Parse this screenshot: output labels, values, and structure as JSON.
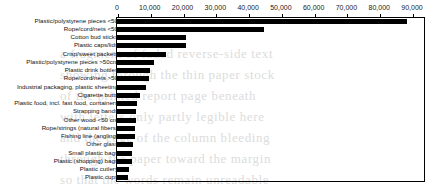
{
  "chart_data": {
    "type": "bar",
    "orientation": "horizontal",
    "title": "",
    "subtitle": "",
    "xlabel": "",
    "ylabel": "",
    "xlim": [
      0,
      90000
    ],
    "grid": false,
    "legend": null,
    "axis_position": "top",
    "bar_color": "#000000",
    "frame_color": "#000000",
    "background": "#ffffff",
    "xticks": [
      0,
      10000,
      20000,
      30000,
      40000,
      50000,
      60000,
      70000,
      80000,
      90000
    ],
    "xticklabels": [
      "0",
      "10,000",
      "20,000",
      "30,000",
      "40,000",
      "50,000",
      "60,000",
      "70,000",
      "80,000",
      "90,000"
    ],
    "categories": [
      "Plastic/polystyrene pieces <50",
      "Rope/cord/nets <50",
      "Cotton bud sticks",
      "Plastic caps/lids",
      "Crisp/sweet packets",
      "Plastic/polystyrene pieces >50cm",
      "Plastic drink bottles",
      "Rope/cord/nets >50",
      "Industrial packaging, plastic sheeting",
      "Cigarette butts",
      "Plastic food, incl. fast food, containers",
      "Strapping bands",
      "Other wood <50 cm",
      "Rope/strings (natural fibers)",
      "Fishing line (angling)",
      "Other glass",
      "Small plastic bags",
      "Plastic (shopping) bags",
      "Plastic cutlery",
      "Plastic cups"
    ],
    "values": [
      88500,
      44800,
      21200,
      21000,
      14800,
      11400,
      10100,
      9700,
      8800,
      7000,
      6000,
      5900,
      5700,
      5500,
      5400,
      5000,
      4700,
      4600,
      3700,
      3500
    ]
  },
  "ghost_text": [
    "a fragment of faded reverse-side text",
    "showing through the thin paper stock",
    "of the printed report page beneath",
    "with letters only partly legible here",
    "and the edge of the column bleeding",
    "through the paper toward the margin",
    "so that the words remain unreadable"
  ]
}
